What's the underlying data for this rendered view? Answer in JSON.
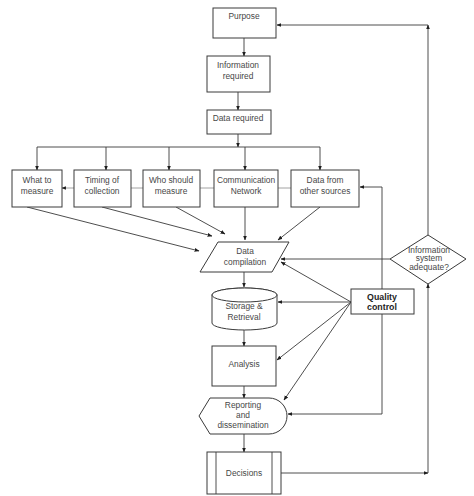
{
  "diagram": {
    "type": "flowchart",
    "colors": {
      "stroke": "#3a3a3a",
      "text": "#474747",
      "background": "#ffffff"
    },
    "nodes": {
      "purpose": {
        "shape": "rectangle",
        "lines": [
          "Purpose"
        ]
      },
      "information_required": {
        "shape": "rectangle",
        "lines": [
          "Information",
          "required"
        ]
      },
      "data_required": {
        "shape": "rectangle",
        "lines": [
          "Data required"
        ]
      },
      "what_to_measure": {
        "shape": "rectangle",
        "lines": [
          "What to",
          "measure"
        ]
      },
      "timing_of_collection": {
        "shape": "rectangle",
        "lines": [
          "Timing of",
          "collection"
        ]
      },
      "who_should_measure": {
        "shape": "rectangle",
        "lines": [
          "Who should",
          "measure"
        ]
      },
      "communication_network": {
        "shape": "rectangle",
        "lines": [
          "Communication",
          "Network"
        ]
      },
      "data_from_other_sources": {
        "shape": "rectangle",
        "lines": [
          "Data from",
          "other sources"
        ]
      },
      "data_compilation": {
        "shape": "parallelogram",
        "lines": [
          "Data",
          "compilation"
        ]
      },
      "storage_retrieval": {
        "shape": "cylinder",
        "lines": [
          "Storage &",
          "Retrieval"
        ]
      },
      "analysis": {
        "shape": "rectangle",
        "lines": [
          "Analysis"
        ]
      },
      "reporting_dissemination": {
        "shape": "display",
        "lines": [
          "Reporting",
          "and",
          "dissemination"
        ]
      },
      "decisions": {
        "shape": "predefined-process",
        "lines": [
          "Decisions"
        ]
      },
      "quality_control": {
        "shape": "rectangle",
        "lines": [
          "Quality",
          "control"
        ]
      },
      "information_system_adequate": {
        "shape": "diamond",
        "lines": [
          "Information",
          "system",
          "adequate?"
        ]
      }
    },
    "edges": [
      [
        "purpose",
        "information_required"
      ],
      [
        "information_required",
        "data_required"
      ],
      [
        "data_required",
        "what_to_measure"
      ],
      [
        "data_required",
        "timing_of_collection"
      ],
      [
        "data_required",
        "who_should_measure"
      ],
      [
        "data_required",
        "communication_network"
      ],
      [
        "data_required",
        "data_from_other_sources"
      ],
      [
        "timing_of_collection",
        "what_to_measure"
      ],
      [
        "what_to_measure",
        "data_compilation"
      ],
      [
        "timing_of_collection",
        "data_compilation"
      ],
      [
        "who_should_measure",
        "data_compilation"
      ],
      [
        "communication_network",
        "data_compilation"
      ],
      [
        "data_from_other_sources",
        "data_compilation"
      ],
      [
        "data_compilation",
        "storage_retrieval"
      ],
      [
        "storage_retrieval",
        "analysis"
      ],
      [
        "analysis",
        "reporting_dissemination"
      ],
      [
        "reporting_dissemination",
        "decisions"
      ],
      [
        "quality_control",
        "data_compilation"
      ],
      [
        "quality_control",
        "storage_retrieval"
      ],
      [
        "quality_control",
        "analysis"
      ],
      [
        "quality_control",
        "reporting_dissemination"
      ],
      [
        "quality_control",
        "data_from_other_sources"
      ],
      [
        "information_system_adequate",
        "data_compilation"
      ],
      [
        "information_system_adequate",
        "purpose"
      ],
      [
        "decisions",
        "information_system_adequate"
      ]
    ]
  }
}
